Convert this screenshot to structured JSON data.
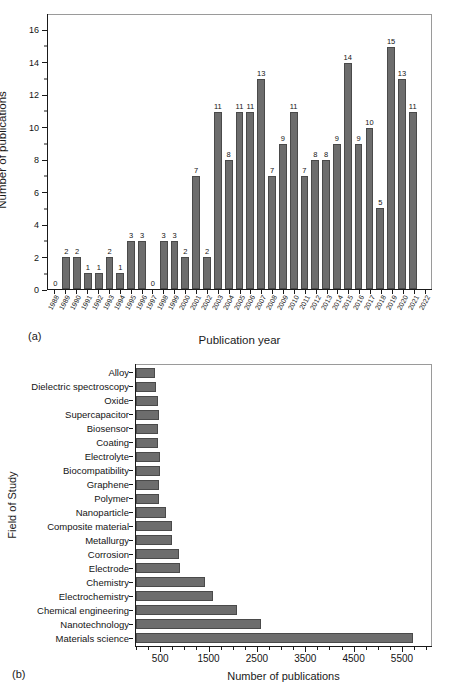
{
  "figure": {
    "panel_a_tag": "(a)",
    "panel_b_tag": "(b)"
  },
  "chart_data": [
    {
      "id": "panel_a",
      "type": "bar",
      "title": "",
      "xlabel": "Publication year",
      "ylabel": "Number of publications",
      "ylim": [
        0,
        17
      ],
      "yticks": [
        0,
        2,
        4,
        6,
        8,
        10,
        12,
        14,
        16
      ],
      "grid": false,
      "legend": "none",
      "bar_color": "#6d6d6d",
      "data_labels": true,
      "categories": [
        "1988",
        "1989",
        "1990",
        "1991",
        "1992",
        "1993",
        "1994",
        "1995",
        "1996",
        "1997",
        "1998",
        "1999",
        "2000",
        "2001",
        "2002",
        "2003",
        "2004",
        "2005",
        "2006",
        "2007",
        "2008",
        "2009",
        "2010",
        "2011",
        "2012",
        "2013",
        "2014",
        "2015",
        "2016",
        "2017",
        "2018",
        "2019",
        "2020",
        "2021",
        "2022"
      ],
      "values": [
        0,
        2,
        2,
        1,
        1,
        2,
        1,
        3,
        3,
        0,
        3,
        3,
        2,
        7,
        2,
        11,
        8,
        11,
        11,
        13,
        7,
        9,
        11,
        7,
        8,
        8,
        9,
        14,
        9,
        10,
        5,
        15,
        13,
        11,
        0
      ]
    },
    {
      "id": "panel_b",
      "type": "bar",
      "orientation": "horizontal",
      "title": "",
      "xlabel": "Number of publications",
      "ylabel": "Field of Study",
      "xlim": [
        0,
        6100
      ],
      "xticks": [
        500,
        1500,
        2500,
        3500,
        4500,
        5500
      ],
      "grid": false,
      "legend": "none",
      "bar_color": "#6d6d6d",
      "data_labels": false,
      "categories": [
        "Alloy",
        "Dielectric spectroscopy",
        "Oxide",
        "Supercapacitor",
        "Biosensor",
        "Coating",
        "Electrolyte",
        "Biocompatibility",
        "Graphene",
        "Polymer",
        "Nanoparticle",
        "Composite material",
        "Metallurgy",
        "Corrosion",
        "Electrode",
        "Chemistry",
        "Electrochemistry",
        "Chemical engineering",
        "Nanotechnology",
        "Materials science"
      ],
      "values": [
        400,
        405,
        465,
        470,
        465,
        460,
        490,
        490,
        480,
        480,
        630,
        740,
        745,
        880,
        900,
        1420,
        1600,
        2090,
        2580,
        5730
      ]
    }
  ]
}
